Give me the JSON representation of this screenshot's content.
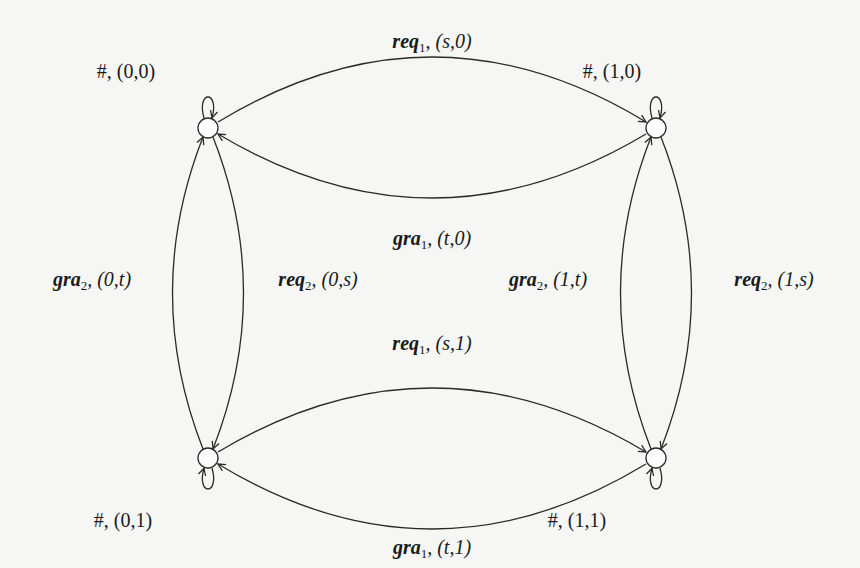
{
  "diagram": {
    "type": "state-machine",
    "nodes": [
      {
        "id": "s00",
        "label_symbol": "#",
        "label_state": "(0,0)",
        "x": 208,
        "y": 128
      },
      {
        "id": "s10",
        "label_symbol": "#",
        "label_state": "(1,0)",
        "x": 656,
        "y": 128
      },
      {
        "id": "s01",
        "label_symbol": "#",
        "label_state": "(0,1)",
        "x": 208,
        "y": 458
      },
      {
        "id": "s11",
        "label_symbol": "#",
        "label_state": "(1,1)",
        "x": 656,
        "y": 458
      }
    ],
    "node_labels": {
      "s00": "#, (0,0)",
      "s10": "#, (1,0)",
      "s01": "#, (0,1)",
      "s11": "#, (1,1)"
    },
    "edges": [
      {
        "from": "s00",
        "to": "s10",
        "action": "req",
        "sub": "1",
        "args": "(s,0)"
      },
      {
        "from": "s10",
        "to": "s00",
        "action": "gra",
        "sub": "1",
        "args": "(t,0)"
      },
      {
        "from": "s01",
        "to": "s00",
        "action": "gra",
        "sub": "2",
        "args": "(0,t)"
      },
      {
        "from": "s00",
        "to": "s01",
        "action": "req",
        "sub": "2",
        "args": "(0,s)"
      },
      {
        "from": "s11",
        "to": "s10",
        "action": "gra",
        "sub": "2",
        "args": "(1,t)"
      },
      {
        "from": "s10",
        "to": "s11",
        "action": "req",
        "sub": "2",
        "args": "(1,s)"
      },
      {
        "from": "s01",
        "to": "s11",
        "action": "req",
        "sub": "1",
        "args": "(s,1)"
      },
      {
        "from": "s11",
        "to": "s01",
        "action": "gra",
        "sub": "1",
        "args": "(t,1)"
      }
    ],
    "self_loops": [
      "s00",
      "s10",
      "s01",
      "s11"
    ],
    "edge_labels": {
      "e1": {
        "action": "req",
        "sub": "1",
        "args": ", (s,0)"
      },
      "e2": {
        "action": "gra",
        "sub": "1",
        "args": ", (t,0)"
      },
      "e3": {
        "action": "gra",
        "sub": "2",
        "args": ", (0,t)"
      },
      "e4": {
        "action": "req",
        "sub": "2",
        "args": ", (0,s)"
      },
      "e5": {
        "action": "gra",
        "sub": "2",
        "args": ", (1,t)"
      },
      "e6": {
        "action": "req",
        "sub": "2",
        "args": ", (1,s)"
      },
      "e7": {
        "action": "req",
        "sub": "1",
        "args": ", (s,1)"
      },
      "e8": {
        "action": "gra",
        "sub": "1",
        "args": ", (t,1)"
      }
    },
    "colors": {
      "stroke": "#2a2a2a",
      "background": "#f6f6f4"
    }
  }
}
